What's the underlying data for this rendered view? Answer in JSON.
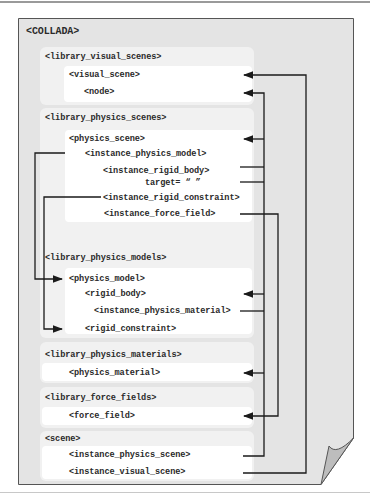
{
  "diagram": {
    "root": "<COLLADA>",
    "sections": [
      {
        "id": "library_visual_scenes",
        "label": "<library_visual_scenes>",
        "items": [
          "<visual_scene>",
          "<node>"
        ]
      },
      {
        "id": "library_physics_scenes",
        "label": "<library_physics_scenes>",
        "items": [
          "<physics_scene>",
          "<instance_physics_model>",
          "<instance_rigid_body>",
          "target= “ ”",
          "<instance_rigid_constraint>",
          "<instance_force_field>"
        ]
      },
      {
        "id": "library_physics_models",
        "label": "<library_physics_models>",
        "items": [
          "<physics_model>",
          "<rigid_body>",
          "<instance_physics_material>",
          "<rigid_constraint>"
        ]
      },
      {
        "id": "library_physics_materials",
        "label": "<library_physics_materials>",
        "items": [
          "<physics_material>"
        ]
      },
      {
        "id": "library_force_fields",
        "label": "<library_force_fields>",
        "items": [
          "<force_field>"
        ]
      },
      {
        "id": "scene",
        "label": "<scene>",
        "items": [
          "<instance_physics_scene>",
          "<instance_visual_scene>"
        ]
      }
    ],
    "connections": [
      {
        "from": "<instance_visual_scene>",
        "to": "<visual_scene>"
      },
      {
        "from": "<instance_physics_scene>",
        "to": "<physics_scene>"
      },
      {
        "from": "<instance_rigid_body> target",
        "to": "<node>"
      },
      {
        "from": "<instance_rigid_body>",
        "to": "<rigid_body>"
      },
      {
        "from": "<instance_physics_material>",
        "to": "<physics_material>"
      },
      {
        "from": "<instance_force_field>",
        "to": "<force_field>"
      },
      {
        "from": "<instance_physics_model>",
        "to": "<physics_model>"
      },
      {
        "from": "<instance_rigid_constraint>",
        "to": "<rigid_constraint>"
      }
    ],
    "colors": {
      "page": "#e4e4e4",
      "panel": "#f1f1f1",
      "inner": "#ffffff",
      "line": "#1a1a1a",
      "border": "#555555",
      "curl": "#bdbdbd"
    }
  }
}
